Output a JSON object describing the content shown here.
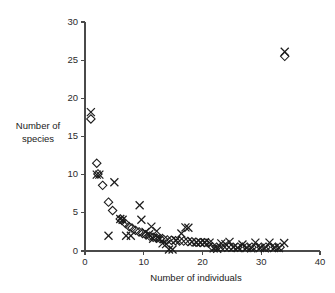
{
  "chart_data": {
    "type": "scatter",
    "title": "",
    "xlabel": "Number of individuals",
    "ylabel": "Number of species",
    "ylabel_line1": "Number of",
    "ylabel_line2": "species",
    "xlim": [
      0,
      40
    ],
    "ylim": [
      0,
      30
    ],
    "xticks": [
      0,
      10,
      20,
      30,
      40
    ],
    "yticks": [
      0,
      5,
      10,
      15,
      20,
      25,
      30
    ],
    "xtick_labels": [
      "0",
      "10",
      "20",
      "30",
      "40"
    ],
    "ytick_labels": [
      "0",
      "5",
      "10",
      "15",
      "20",
      "25",
      "30"
    ],
    "grid": false,
    "legend": "none",
    "marker_color": "#1c1c1c",
    "series": [
      {
        "name": "cross",
        "marker": "x",
        "points": [
          [
            1,
            18.2
          ],
          [
            2,
            10.0
          ],
          [
            2.45,
            10.0
          ],
          [
            4,
            2.0
          ],
          [
            5,
            9.0
          ],
          [
            6,
            4.2
          ],
          [
            6.4,
            4.1
          ],
          [
            7,
            2.0
          ],
          [
            7.8,
            2.0
          ],
          [
            9.3,
            6.0
          ],
          [
            9.6,
            4.1
          ],
          [
            10.3,
            2.5
          ],
          [
            10.9,
            2.2
          ],
          [
            11.3,
            3.2
          ],
          [
            11.6,
            1.6
          ],
          [
            12.2,
            2.6
          ],
          [
            12.6,
            1.7
          ],
          [
            13.2,
            1.0
          ],
          [
            13.8,
            0.9
          ],
          [
            14.3,
            0.2
          ],
          [
            14.9,
            0.2
          ],
          [
            15.5,
            1.4
          ],
          [
            16.4,
            2.3
          ],
          [
            17.1,
            3.1
          ],
          [
            17.6,
            3.05
          ],
          [
            18.2,
            1.2
          ],
          [
            19.0,
            1.1
          ],
          [
            19.7,
            1.1
          ],
          [
            20.4,
            1.15
          ],
          [
            21.2,
            1.1
          ],
          [
            21.9,
            0.35
          ],
          [
            22.5,
            0.3
          ],
          [
            23.2,
            1.0
          ],
          [
            23.9,
            0.9
          ],
          [
            24.6,
            1.2
          ],
          [
            25.3,
            0.5
          ],
          [
            26.0,
            0.4
          ],
          [
            26.8,
            0.85
          ],
          [
            27.5,
            0.4
          ],
          [
            28.3,
            0.35
          ],
          [
            29.0,
            1.1
          ],
          [
            29.8,
            0.4
          ],
          [
            30.6,
            0.35
          ],
          [
            31.4,
            1.1
          ],
          [
            32.2,
            0.4
          ],
          [
            33.0,
            0.4
          ],
          [
            33.9,
            1.05
          ],
          [
            34.0,
            26.1
          ]
        ]
      },
      {
        "name": "diamond",
        "marker": "d",
        "points": [
          [
            1,
            17.3
          ],
          [
            2,
            11.5
          ],
          [
            2.2,
            10.1
          ],
          [
            3,
            8.6
          ],
          [
            4,
            6.4
          ],
          [
            4.7,
            5.3
          ],
          [
            6,
            4.2
          ],
          [
            6.3,
            4.0
          ],
          [
            6.9,
            3.6
          ],
          [
            7.5,
            3.2
          ],
          [
            8.0,
            3.0
          ],
          [
            8.6,
            2.7
          ],
          [
            9.2,
            2.5
          ],
          [
            9.8,
            2.3
          ],
          [
            10.4,
            2.1
          ],
          [
            11.0,
            1.95
          ],
          [
            11.6,
            1.8
          ],
          [
            12.2,
            1.7
          ],
          [
            12.8,
            1.6
          ],
          [
            13.4,
            1.5
          ],
          [
            14.0,
            1.45
          ],
          [
            14.7,
            1.4
          ],
          [
            15.4,
            1.35
          ],
          [
            16.1,
            1.3
          ],
          [
            16.8,
            1.3
          ],
          [
            17.5,
            1.25
          ],
          [
            18.2,
            1.2
          ],
          [
            18.9,
            1.15
          ],
          [
            19.6,
            1.1
          ],
          [
            20.3,
            1.1
          ],
          [
            21.0,
            1.05
          ],
          [
            21.7,
            0.55
          ],
          [
            22.4,
            0.5
          ],
          [
            23.1,
            0.5
          ],
          [
            23.8,
            0.5
          ],
          [
            24.5,
            0.5
          ],
          [
            25.2,
            0.5
          ],
          [
            26.0,
            0.5
          ],
          [
            26.8,
            0.5
          ],
          [
            27.6,
            0.5
          ],
          [
            28.4,
            0.5
          ],
          [
            29.2,
            0.5
          ],
          [
            30.0,
            0.5
          ],
          [
            30.8,
            0.5
          ],
          [
            31.6,
            0.5
          ],
          [
            32.4,
            0.5
          ],
          [
            33.2,
            0.5
          ],
          [
            34.0,
            25.5
          ]
        ]
      }
    ]
  },
  "geometry": {
    "x0_px": 85,
    "x40_px": 320,
    "y0_px": 251,
    "y30_px": 22,
    "marker_size": 4.0
  }
}
